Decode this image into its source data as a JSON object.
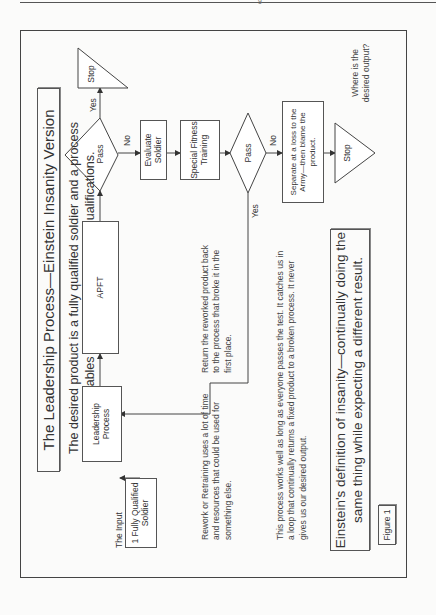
{
  "page": {
    "header_mark": "g"
  },
  "diagram": {
    "title": "The Leadership Process—Einstein Insanity Version",
    "subtitle_line1": "The desired product is a fully qualified soldier and a process",
    "subtitle_line2": "that enables the soldier to maintain qualifications.",
    "input_label": "The Input",
    "nodes": {
      "input": "1 Fully Qualified Soldier",
      "leadership": "Leadership Process",
      "apft": "APFT",
      "pass1": "Pass",
      "stop1": "Stop",
      "evaluate": "Evaluate Soldier",
      "special_training": "Special Fitness Training",
      "pass2": "Pass",
      "separate": "Separate at a loss to the Army—then blame the product.",
      "stop2": "Stop"
    },
    "edge_labels": {
      "pass1_yes": "Yes",
      "pass1_no": "No",
      "pass2_yes": "Yes",
      "pass2_no": "No"
    },
    "notes": {
      "desired_output": "Where is the desired output?",
      "rework": "Rework or Retraining uses a lot of time and resources that could be used for something else.",
      "return": "Return the reworked product back to the process that broke it in the first place.",
      "loop": "This process works well as long as everyone passes the test. It catches us in a loop that continually returns a fixed product to a broken process. It never gives us our desired output."
    },
    "einstein_line1": "Einstein's definition of insanity—continually doing the",
    "einstein_line2": "same thing while expecting a different result.",
    "figure_label": "Figure 1"
  }
}
